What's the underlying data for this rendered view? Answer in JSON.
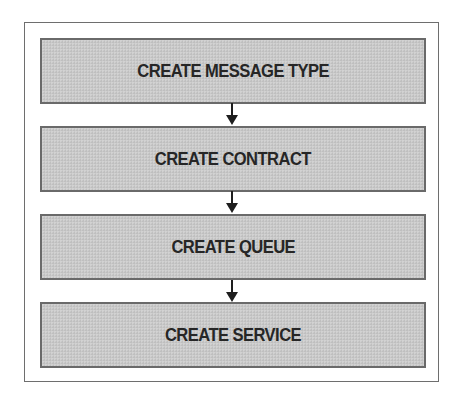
{
  "diagram": {
    "type": "flowchart",
    "direction": "top-to-bottom",
    "steps": [
      {
        "label": "CREATE MESSAGE TYPE"
      },
      {
        "label": "CREATE CONTRACT"
      },
      {
        "label": "CREATE QUEUE"
      },
      {
        "label": "CREATE SERVICE"
      }
    ],
    "edges": [
      {
        "from": "CREATE MESSAGE TYPE",
        "to": "CREATE CONTRACT",
        "icon": "arrow-down-icon"
      },
      {
        "from": "CREATE CONTRACT",
        "to": "CREATE QUEUE",
        "icon": "arrow-down-icon"
      },
      {
        "from": "CREATE QUEUE",
        "to": "CREATE SERVICE",
        "icon": "arrow-down-icon"
      }
    ],
    "colors": {
      "box_fill": "#c9c9c9",
      "box_border": "#6a6a6a",
      "text": "#262626",
      "frame_border": "#6e6e6e",
      "arrow": "#1e1e1e"
    }
  }
}
